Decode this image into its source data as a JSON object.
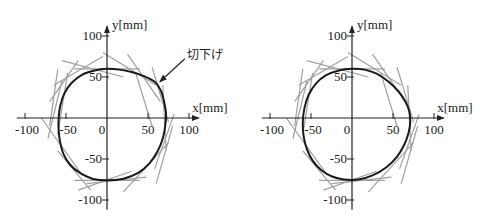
{
  "chart_data": [
    {
      "type": "diagram",
      "title": "",
      "xlabel": "x[mm]",
      "ylabel": "y[mm]",
      "xlim": [
        -100,
        100
      ],
      "ylim": [
        -100,
        100
      ],
      "x_ticks": [
        -100,
        -50,
        0,
        50,
        100
      ],
      "y_ticks": [
        100,
        50,
        -50,
        -100
      ],
      "x_tick_labels": [
        "-100",
        "-50",
        "0",
        "50",
        "100"
      ],
      "y_tick_labels": [
        "100",
        "50",
        "-50",
        "-100"
      ],
      "origin_label": "0",
      "profile": {
        "name": "cam-profile",
        "color": "#1a1a1a",
        "points": [
          [
            0,
            60
          ],
          [
            15,
            59
          ],
          [
            30,
            56
          ],
          [
            45,
            51
          ],
          [
            57,
            45
          ],
          [
            62,
            40
          ],
          [
            67,
            30
          ],
          [
            70,
            18
          ],
          [
            72,
            5
          ],
          [
            71,
            -10
          ],
          [
            68,
            -25
          ],
          [
            62,
            -40
          ],
          [
            52,
            -55
          ],
          [
            38,
            -67
          ],
          [
            20,
            -74
          ],
          [
            0,
            -76
          ],
          [
            -18,
            -74
          ],
          [
            -33,
            -67
          ],
          [
            -45,
            -57
          ],
          [
            -53,
            -44
          ],
          [
            -57,
            -30
          ],
          [
            -59,
            -15
          ],
          [
            -59,
            0
          ],
          [
            -57,
            15
          ],
          [
            -52,
            30
          ],
          [
            -43,
            43
          ],
          [
            -30,
            53
          ],
          [
            -15,
            58
          ],
          [
            0,
            60
          ]
        ]
      },
      "envelope_lines_color": "#a0a0a0",
      "envelope_lines": [
        [
          [
            -40,
            60
          ],
          [
            40,
            60
          ]
        ],
        [
          [
            -40,
            -76
          ],
          [
            40,
            -76
          ]
        ],
        [
          [
            -60,
            -20
          ],
          [
            -48,
            55
          ]
        ],
        [
          [
            -65,
            40
          ],
          [
            -5,
            75
          ]
        ],
        [
          [
            -5,
            80
          ],
          [
            60,
            40
          ]
        ],
        [
          [
            25,
            78
          ],
          [
            65,
            20
          ]
        ],
        [
          [
            55,
            62
          ],
          [
            75,
            -5
          ]
        ],
        [
          [
            68,
            40
          ],
          [
            72,
            -40
          ]
        ],
        [
          [
            82,
            5
          ],
          [
            58,
            -62
          ]
        ],
        [
          [
            75,
            -30
          ],
          [
            20,
            -90
          ]
        ],
        [
          [
            48,
            -72
          ],
          [
            -25,
            -80
          ]
        ],
        [
          [
            -20,
            -88
          ],
          [
            -60,
            -40
          ]
        ],
        [
          [
            -72,
            -25
          ],
          [
            -55,
            45
          ]
        ],
        [
          [
            -80,
            0
          ],
          [
            -30,
            -70
          ]
        ],
        [
          [
            -70,
            20
          ],
          [
            -35,
            70
          ]
        ],
        [
          [
            -55,
            70
          ],
          [
            20,
            50
          ]
        ],
        [
          [
            -35,
            -88
          ],
          [
            30,
            -65
          ]
        ],
        [
          [
            60,
            -80
          ],
          [
            80,
            -10
          ]
        ],
        [
          [
            35,
            55
          ],
          [
            55,
            -10
          ]
        ],
        [
          [
            -60,
            60
          ],
          [
            -70,
            -10
          ]
        ]
      ],
      "annotation": {
        "text": "切下げ",
        "points_to": [
          62,
          43
        ]
      }
    },
    {
      "type": "diagram",
      "title": "",
      "xlabel": "x[mm]",
      "ylabel": "y[mm]",
      "xlim": [
        -100,
        100
      ],
      "ylim": [
        -100,
        100
      ],
      "x_ticks": [
        -100,
        -50,
        0,
        50,
        100
      ],
      "y_ticks": [
        100,
        50,
        -50,
        -100
      ],
      "x_tick_labels": [
        "-100",
        "-50",
        "0",
        "50",
        "100"
      ],
      "y_tick_labels": [
        "100",
        "50",
        "-50",
        "-100"
      ],
      "origin_label": "0",
      "profile": {
        "name": "cam-profile",
        "color": "#1a1a1a",
        "points": [
          [
            0,
            60
          ],
          [
            15,
            59
          ],
          [
            30,
            54
          ],
          [
            45,
            44
          ],
          [
            57,
            32
          ],
          [
            65,
            20
          ],
          [
            70,
            8
          ],
          [
            71,
            -5
          ],
          [
            69,
            -18
          ],
          [
            64,
            -32
          ],
          [
            55,
            -47
          ],
          [
            42,
            -60
          ],
          [
            25,
            -70
          ],
          [
            8,
            -75
          ],
          [
            -10,
            -75
          ],
          [
            -25,
            -71
          ],
          [
            -38,
            -63
          ],
          [
            -48,
            -52
          ],
          [
            -55,
            -38
          ],
          [
            -59,
            -22
          ],
          [
            -60,
            -5
          ],
          [
            -58,
            12
          ],
          [
            -53,
            28
          ],
          [
            -44,
            42
          ],
          [
            -32,
            52
          ],
          [
            -16,
            58
          ],
          [
            0,
            60
          ]
        ]
      },
      "envelope_lines_color": "#a0a0a0",
      "envelope_lines": [
        [
          [
            -40,
            60
          ],
          [
            40,
            60
          ]
        ],
        [
          [
            -40,
            -76
          ],
          [
            40,
            -76
          ]
        ],
        [
          [
            -60,
            -20
          ],
          [
            -48,
            55
          ]
        ],
        [
          [
            -65,
            40
          ],
          [
            -5,
            75
          ]
        ],
        [
          [
            -5,
            80
          ],
          [
            60,
            40
          ]
        ],
        [
          [
            25,
            78
          ],
          [
            65,
            20
          ]
        ],
        [
          [
            55,
            62
          ],
          [
            75,
            -5
          ]
        ],
        [
          [
            68,
            40
          ],
          [
            72,
            -40
          ]
        ],
        [
          [
            82,
            5
          ],
          [
            58,
            -62
          ]
        ],
        [
          [
            75,
            -30
          ],
          [
            20,
            -90
          ]
        ],
        [
          [
            48,
            -72
          ],
          [
            -25,
            -80
          ]
        ],
        [
          [
            -20,
            -88
          ],
          [
            -60,
            -40
          ]
        ],
        [
          [
            -72,
            -25
          ],
          [
            -55,
            45
          ]
        ],
        [
          [
            -80,
            0
          ],
          [
            -30,
            -70
          ]
        ],
        [
          [
            -70,
            20
          ],
          [
            -35,
            70
          ]
        ],
        [
          [
            -55,
            70
          ],
          [
            20,
            50
          ]
        ],
        [
          [
            -35,
            -88
          ],
          [
            30,
            -65
          ]
        ],
        [
          [
            60,
            -80
          ],
          [
            80,
            -10
          ]
        ],
        [
          [
            35,
            55
          ],
          [
            55,
            -10
          ]
        ],
        [
          [
            -60,
            60
          ],
          [
            -70,
            -10
          ]
        ]
      ]
    }
  ]
}
